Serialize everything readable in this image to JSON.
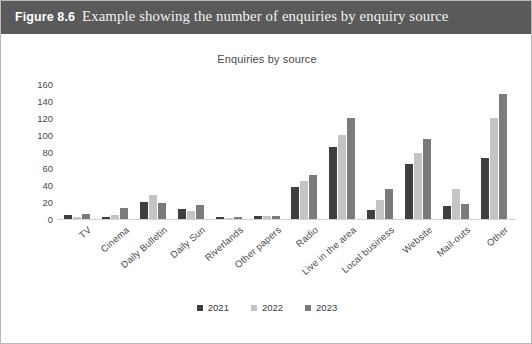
{
  "figure": {
    "caption_label": "Figure 8.6",
    "caption_text": "Example showing the number of enquiries by enquiry source",
    "caption_bar_color": "#5a5a5a",
    "caption_text_color": "#ffffff"
  },
  "chart_data": {
    "type": "bar",
    "title": "Enquiries by source",
    "xlabel": "",
    "ylabel": "",
    "ylim": [
      0,
      160
    ],
    "yticks": [
      0,
      20,
      40,
      60,
      80,
      100,
      120,
      140,
      160
    ],
    "grid": false,
    "legend_position": "bottom",
    "categories": [
      "TV",
      "Cinema",
      "Daily Bulletin",
      "Daily Sun",
      "Riverlands",
      "Other papers",
      "Radio",
      "Live in the area",
      "Local business",
      "Website",
      "Mail-outs",
      "Other"
    ],
    "series": [
      {
        "name": "2021",
        "color": "#3f3f3f",
        "values": [
          5,
          2,
          20,
          12,
          2,
          4,
          38,
          85,
          11,
          65,
          15,
          72
        ]
      },
      {
        "name": "2022",
        "color": "#c4c4c4",
        "values": [
          2,
          5,
          28,
          9,
          1,
          3,
          45,
          100,
          22,
          78,
          35,
          120
        ]
      },
      {
        "name": "2023",
        "color": "#7b7b7b",
        "values": [
          6,
          13,
          19,
          17,
          2,
          3,
          52,
          120,
          35,
          95,
          18,
          148
        ]
      }
    ]
  },
  "legend": {
    "items": [
      {
        "label": "2021",
        "color": "#3f3f3f"
      },
      {
        "label": "2022",
        "color": "#c4c4c4"
      },
      {
        "label": "2023",
        "color": "#7b7b7b"
      }
    ]
  }
}
